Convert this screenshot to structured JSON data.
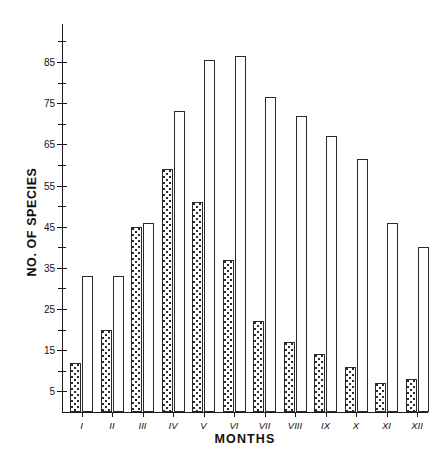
{
  "chart_data": {
    "type": "bar",
    "title": "",
    "xlabel": "MONTHS",
    "ylabel": "NO. OF SPECIES",
    "categories": [
      "I",
      "II",
      "III",
      "IV",
      "V",
      "VI",
      "VII",
      "VIII",
      "IX",
      "X",
      "XI",
      "XII"
    ],
    "series": [
      {
        "name": "shaded",
        "style": "stippled",
        "values": [
          12,
          20,
          45,
          59,
          51,
          37,
          22,
          17,
          14,
          11,
          7,
          8
        ]
      },
      {
        "name": "open",
        "style": "white",
        "values": [
          33,
          33,
          46,
          73,
          85.5,
          86.5,
          76.5,
          72,
          67,
          61.5,
          46,
          40
        ]
      }
    ],
    "ylim": [
      0,
      94
    ],
    "ytick_major": [
      5,
      15,
      25,
      35,
      45,
      55,
      65,
      75,
      85
    ],
    "ytick_major_labels": [
      "5",
      "15",
      "25",
      "35",
      "45",
      "55",
      "65",
      "75",
      "85"
    ],
    "ytick_minor": [
      10,
      20,
      30,
      40,
      50,
      60,
      70,
      80,
      90
    ],
    "grid": false,
    "legend": "none",
    "bar_colors": {
      "shaded_fill": "#ffffff",
      "shaded_dots": "#2b2b2b",
      "open_fill": "#ffffff",
      "outline": "#2a2a2a"
    }
  }
}
